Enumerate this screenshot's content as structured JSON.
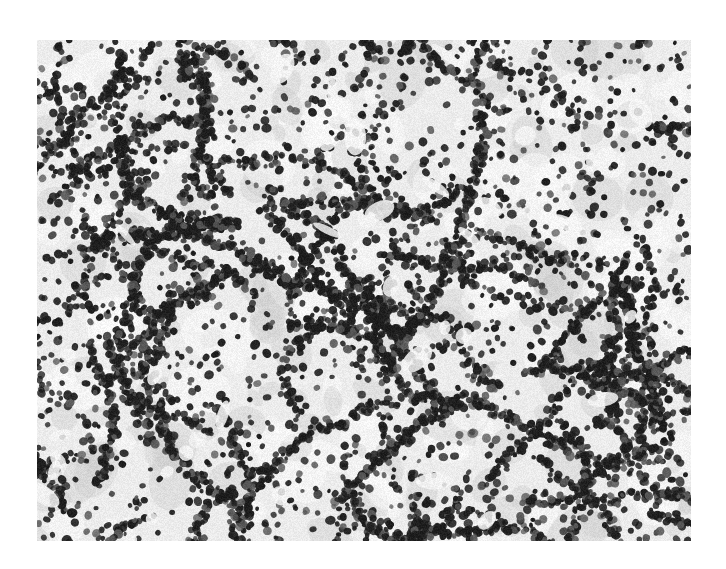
{
  "image": {
    "kind": "grayscale histology micrograph",
    "description": "Dense sheets and cords of darkly stained nuclei separated by pale stroma",
    "frame": {
      "x": 37,
      "y": 40,
      "width": 654,
      "height": 501
    },
    "colors": {
      "background": "#ffffff",
      "stroma": "#ececec",
      "stroma_dark": "#c9c9c9",
      "nucleus": "#1e1e1e",
      "nucleus_light": "#5a5a5a"
    },
    "render": {
      "seed": 1337,
      "cord_count": 95,
      "nuclei_per_cord": 26,
      "scatter_nuclei": 1600,
      "nucleus_radius_min": 2.2,
      "nucleus_radius_max": 4.6,
      "pale_patch_count": 40
    }
  }
}
